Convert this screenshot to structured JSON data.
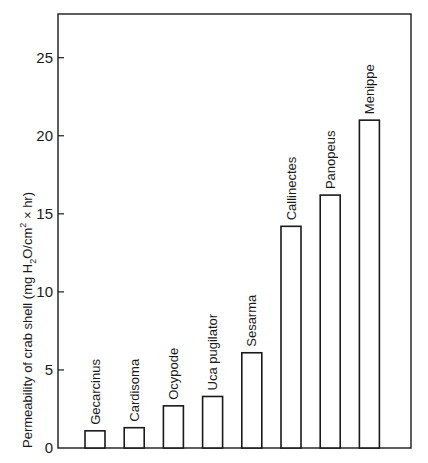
{
  "chart_data": {
    "type": "bar",
    "title": "",
    "xlabel": "",
    "ylabel": "Permeability of crab shell (mg H2O/cm2 × hr)",
    "ylabel_parts": {
      "pre": "Permeability of crab shell (mg H",
      "sub": "2",
      "mid": "O/cm",
      "sup": "2",
      "post": " × hr)"
    },
    "categories": [
      "Gecarcinus",
      "Cardisoma",
      "Ocypode",
      "Uca pugilator",
      "Sesarma",
      "Callinectes",
      "Panopeus",
      "Menippe"
    ],
    "values": [
      1.1,
      1.3,
      2.7,
      3.3,
      6.1,
      14.2,
      16.2,
      21.0
    ],
    "yticks": [
      0,
      5,
      10,
      15,
      20,
      25
    ],
    "ylim": [
      0,
      27.8
    ],
    "grid": false,
    "legend": null,
    "bar_labels_rotated": true,
    "colors": {
      "bar_fill": "#ffffff",
      "bar_stroke": "#1a1a1a",
      "axis": "#1a1a1a"
    }
  }
}
